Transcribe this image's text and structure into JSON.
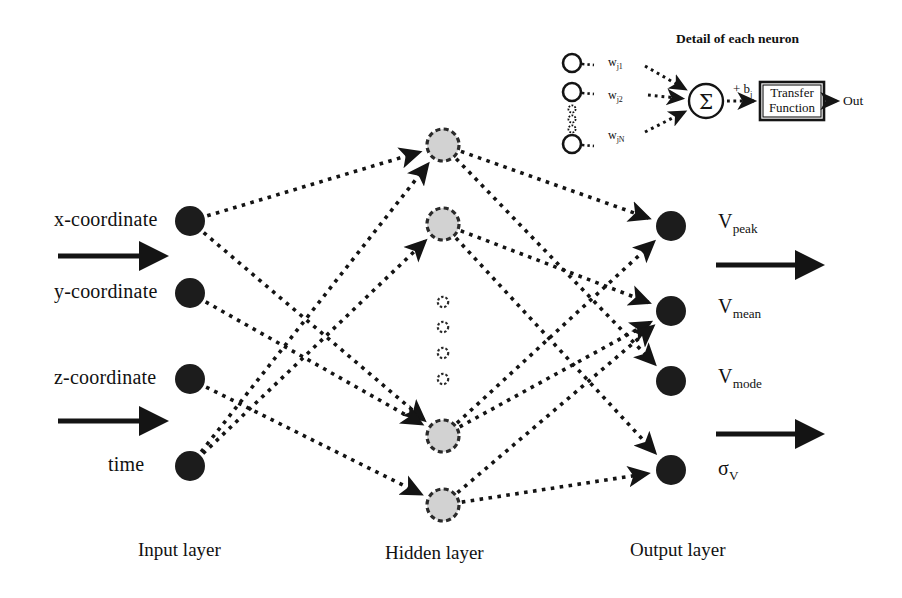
{
  "figure": {
    "ink_color": "#141414",
    "node_input_color": "#1c1c1c",
    "node_hidden_fill": "#d2d2d2",
    "node_hidden_stroke": "#2a2a2a",
    "node_output_color": "#1c1c1c",
    "background": "#ffffff"
  },
  "layers": {
    "input": {
      "label": "Input layer",
      "nodes": [
        {
          "label": "x-coordinate",
          "cx": 190,
          "cy": 221
        },
        {
          "label": "y-coordinate",
          "cx": 190,
          "cy": 293
        },
        {
          "label": "z-coordinate",
          "cx": 190,
          "cy": 379
        },
        {
          "label": "time",
          "cx": 190,
          "cy": 466
        }
      ],
      "label_x": 138,
      "label_y": 548
    },
    "hidden": {
      "label": "Hidden layer",
      "nodes": [
        {
          "cx": 443,
          "cy": 145
        },
        {
          "cx": 443,
          "cy": 224
        },
        {
          "cx": 443,
          "cy": 436
        },
        {
          "cx": 443,
          "cy": 505
        }
      ],
      "ellipsis": [
        {
          "cx": 443,
          "cy": 302
        },
        {
          "cx": 443,
          "cy": 327
        },
        {
          "cx": 443,
          "cy": 353
        },
        {
          "cx": 443,
          "cy": 379
        }
      ],
      "label_x": 385,
      "label_y": 551
    },
    "output": {
      "label": "Output layer",
      "nodes": [
        {
          "label": "V",
          "sub": "peak",
          "cx": 671,
          "cy": 226
        },
        {
          "label": "V",
          "sub": "mean",
          "cx": 671,
          "cy": 311
        },
        {
          "label": "V",
          "sub": "mode",
          "cx": 671,
          "cy": 381
        },
        {
          "label": "σ",
          "sub": "V",
          "cx": 671,
          "cy": 470
        }
      ],
      "label_x": 630,
      "label_y": 548
    }
  },
  "flow_arrows": {
    "input_side": [
      {
        "x1": 58,
        "y1": 256,
        "x2": 162,
        "y2": 256
      },
      {
        "x1": 58,
        "y1": 421,
        "x2": 162,
        "y2": 421
      }
    ],
    "output_side": [
      {
        "x1": 716,
        "y1": 265,
        "x2": 818,
        "y2": 265
      },
      {
        "x1": 716,
        "y1": 434,
        "x2": 818,
        "y2": 434
      }
    ]
  },
  "connections": {
    "input_to_hidden": [
      {
        "from": 0,
        "to": 0
      },
      {
        "from": 0,
        "to": 2
      },
      {
        "from": 1,
        "to": 2
      },
      {
        "from": 2,
        "to": 3
      },
      {
        "from": 3,
        "to": 0
      },
      {
        "from": 3,
        "to": 1
      }
    ],
    "hidden_to_output": [
      {
        "from": 0,
        "to": 0
      },
      {
        "from": 0,
        "to": 2
      },
      {
        "from": 1,
        "to": 1
      },
      {
        "from": 1,
        "to": 3
      },
      {
        "from": 2,
        "to": 0
      },
      {
        "from": 2,
        "to": 1
      },
      {
        "from": 3,
        "to": 1
      },
      {
        "from": 3,
        "to": 3
      }
    ]
  },
  "inset": {
    "title": "Detail of each neuron",
    "title_x": 676,
    "title_y": 32,
    "weights": [
      {
        "symbol": "w",
        "sub": "j1",
        "circle_cx": 572,
        "circle_cy": 63,
        "label_x": 608,
        "label_y": 57
      },
      {
        "symbol": "w",
        "sub": "j2",
        "circle_cx": 572,
        "circle_cy": 92,
        "label_x": 608,
        "label_y": 90
      },
      {
        "symbol": "w",
        "sub": "jN",
        "circle_cx": 572,
        "circle_cy": 144,
        "label_x": 608,
        "label_y": 130
      }
    ],
    "weight_ellipsis": [
      {
        "cx": 572,
        "cy": 109
      },
      {
        "cx": 572,
        "cy": 119
      },
      {
        "cx": 572,
        "cy": 129
      }
    ],
    "summation": {
      "glyph": "Σ",
      "cx": 706,
      "cy": 101,
      "r": 17
    },
    "bias": {
      "text": "+ b",
      "sub": "j",
      "x": 733,
      "y": 83
    },
    "transfer": {
      "line1": "Transfer",
      "line2": "Function",
      "x": 760,
      "y": 82,
      "w": 64,
      "h": 38
    },
    "output": {
      "label": "Out",
      "x": 843,
      "y": 94
    }
  }
}
